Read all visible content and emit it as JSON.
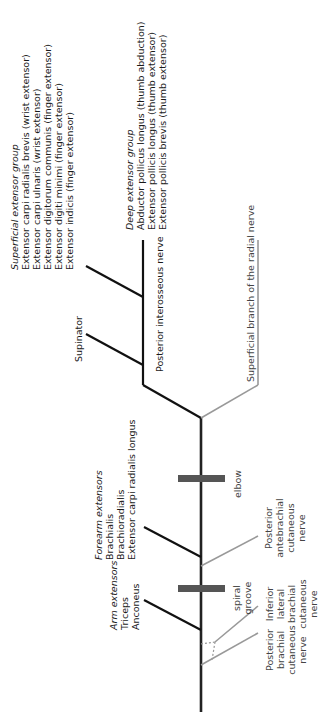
{
  "diagram": {
    "landmarks": {
      "elbow": "elbow",
      "spiral_groove": [
        "spiral",
        "groove"
      ]
    },
    "muscle_groups": {
      "superficial_extensor": {
        "heading": "Superficial extensor group",
        "items": [
          "Extensor carpi radialis brevis (wrist extensor)",
          "Extensor carpi ulnaris (wrist extensor)",
          "Extensor digitorum communis (finger extensor)",
          "Extensor digiti minimi (finger extensor)",
          "Extensor indicis (finger extensor)"
        ]
      },
      "deep_extensor": {
        "heading": "Deep extensor group",
        "items": [
          "Abductor pollicus longus  (thumb abduction)",
          "Extensor pollicis longus (thumb extensor)",
          "Extensor pollicis brevis (thumb extensor)"
        ]
      },
      "supinator": "Supinator",
      "forearm_extensors": {
        "heading": "Forearm extensors",
        "items": [
          "Brachialis",
          "Brachioradialis",
          "Extensor carpi radialis longus"
        ]
      },
      "arm_extensors": {
        "heading": "Arm extensors",
        "items": [
          "Triceps",
          "Anconeus"
        ]
      }
    },
    "nerves": {
      "posterior_interosseous": "Posterior interosseous nerve",
      "superficial_branch": "Superficial branch of the radial nerve",
      "posterior_antebrachial_cutaneous": [
        "Posterior",
        "antebrachial",
        "cutaneous",
        "nerve"
      ],
      "inferior_lateral_brachial_cutaneous": [
        "Inferior",
        "lateral",
        "brachial",
        "cutaneous",
        "nerve"
      ],
      "posterior_brachial_cutaneous": [
        "Posterior",
        "brachial",
        "cutaneous",
        "nerve"
      ]
    },
    "colors": {
      "motor_line": "#111111",
      "sensory_line": "#999999",
      "landmark_bar": "#555555"
    }
  }
}
